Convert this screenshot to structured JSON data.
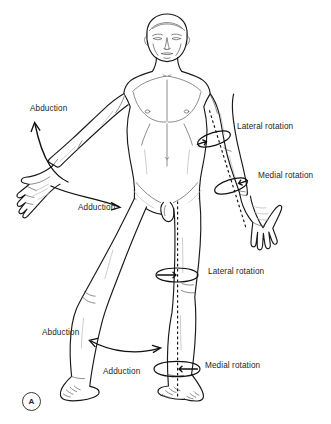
{
  "figure": {
    "panel_label": "A",
    "caption_letter": "A",
    "background_color": "#ffffff",
    "ink_color": "#1a1a1a",
    "text_color": "#231f20"
  },
  "labels": {
    "upper_limb": [
      {
        "id": "arm-abduction",
        "text": "Abduction",
        "x": 30,
        "y": 105,
        "movement": "abduction",
        "limb": "upper limb",
        "side": "left"
      },
      {
        "id": "arm-adduction",
        "text": "Adduction",
        "x": 78,
        "y": 204,
        "movement": "adduction",
        "limb": "upper limb",
        "side": "left"
      },
      {
        "id": "arm-lateral-rotation",
        "text": "Lateral rotation",
        "x": 237,
        "y": 123,
        "movement": "lateral rotation",
        "limb": "upper limb",
        "side": "right"
      },
      {
        "id": "arm-medial-rotation",
        "text": "Medial rotation",
        "x": 258,
        "y": 172,
        "movement": "medial rotation",
        "limb": "upper limb",
        "side": "right"
      }
    ],
    "lower_limb": [
      {
        "id": "leg-lateral-rotation",
        "text": "Lateral rotation",
        "x": 208,
        "y": 268,
        "movement": "lateral rotation",
        "limb": "lower limb",
        "side": "right"
      },
      {
        "id": "leg-abduction",
        "text": "Abduction",
        "x": 42,
        "y": 329,
        "movement": "abduction",
        "limb": "lower limb",
        "side": "left"
      },
      {
        "id": "leg-medial-rotation",
        "text": "Medial rotation",
        "x": 205,
        "y": 362,
        "movement": "medial rotation",
        "limb": "lower limb",
        "side": "right"
      },
      {
        "id": "leg-adduction",
        "text": "Adduction",
        "x": 103,
        "y": 368,
        "movement": "adduction",
        "limb": "lower limb",
        "side": "left"
      }
    ]
  },
  "annotations": {
    "rotation_rings": [
      {
        "id": "ring-arm-upper",
        "cx": 214,
        "cy": 139,
        "rx": 17,
        "ry": 6.0,
        "rotate": -18,
        "pairs_with": "arm-lateral-rotation"
      },
      {
        "id": "ring-arm-lower",
        "cx": 231,
        "cy": 186,
        "rx": 17,
        "ry": 6.0,
        "rotate": -18,
        "pairs_with": "arm-medial-rotation"
      },
      {
        "id": "ring-leg-upper",
        "cx": 177,
        "cy": 275,
        "rx": 21,
        "ry": 6.5,
        "rotate": 0,
        "pairs_with": "leg-lateral-rotation"
      },
      {
        "id": "ring-leg-lower",
        "cx": 177,
        "cy": 369,
        "rx": 23,
        "ry": 7.0,
        "rotate": 0,
        "pairs_with": "leg-medial-rotation"
      }
    ],
    "dashed_axes": [
      {
        "id": "axis-arm",
        "description": "longitudinal axis of right upper limb"
      },
      {
        "id": "axis-leg",
        "description": "longitudinal axis of right lower limb"
      }
    ],
    "curved_arrows": [
      {
        "id": "arrow-arm-abduction",
        "direction": "up-left",
        "pairs_with": "arm-abduction"
      },
      {
        "id": "arrow-arm-adduction",
        "direction": "down-right",
        "pairs_with": "arm-adduction"
      },
      {
        "id": "arrow-leg-abadduction",
        "direction": "double",
        "pairs_with": "leg-abduction"
      }
    ]
  }
}
